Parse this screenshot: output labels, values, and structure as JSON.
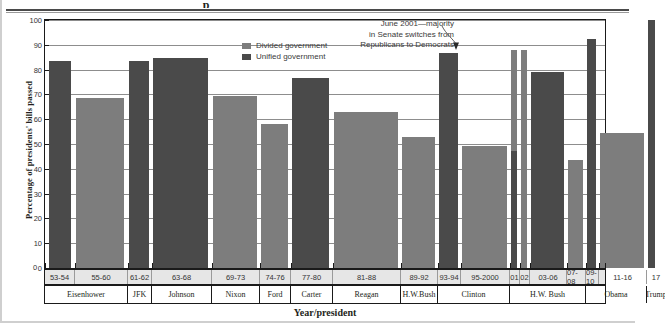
{
  "partial_title_fragment": "p",
  "axes": {
    "ylabel": "Percentage of presidents' bills passed",
    "xlabel": "Year/president",
    "yticks": [
      "0",
      "10",
      "20",
      "30",
      "40",
      "50",
      "60",
      "70",
      "80",
      "90",
      "100"
    ],
    "ymin": 0,
    "ymax": 100
  },
  "legend": {
    "items": [
      {
        "label": "Divided government",
        "color": "#7d7d7d",
        "icon": "legend-swatch"
      },
      {
        "label": "Unified government",
        "color": "#4a4a4a",
        "icon": "legend-swatch"
      }
    ]
  },
  "annotation": {
    "line1": "June 2001—majority",
    "line2": "in Senate switches from",
    "line3": "Republicans to Democrats",
    "icon": "annotation-arrow-icon"
  },
  "colors": {
    "divided": "#7d7d7d",
    "unified": "#4a4a4a",
    "grid": "#8d8d8d",
    "axis": "#1a1a1a",
    "band_fill": "#e6e6e6"
  },
  "presidents": [
    {
      "name": "Eisenhower",
      "span_cols": 2
    },
    {
      "name": "JFK",
      "span_cols": 1
    },
    {
      "name": "Johnson",
      "span_cols": 1
    },
    {
      "name": "Nixon",
      "span_cols": 1
    },
    {
      "name": "Ford",
      "span_cols": 1
    },
    {
      "name": "Carter",
      "span_cols": 1
    },
    {
      "name": "Reagan",
      "span_cols": 1
    },
    {
      "name": "H.W.Bush",
      "span_cols": 1
    },
    {
      "name": "Clinton",
      "span_cols": 2
    },
    {
      "name": "H.W. Bush",
      "span_cols": 4
    },
    {
      "name": "Obama",
      "span_cols": 2
    },
    {
      "name": "Trump",
      "span_cols": 1
    }
  ],
  "chart_data": {
    "type": "bar",
    "title": "",
    "xlabel": "Year/president",
    "ylabel": "Percentage of presidents' bills passed",
    "ylim": [
      0,
      100
    ],
    "ytick_step": 10,
    "grid": true,
    "legend_position": "top-center",
    "categories": [
      "53-54",
      "55-60",
      "61-62",
      "63-68",
      "69-73",
      "74-76",
      "77-80",
      "81-88",
      "89-92",
      "93-94",
      "95-2000",
      "01",
      "02",
      "03-06",
      "07-08",
      "09-10",
      "11-16",
      "17"
    ],
    "president_for_category": [
      "Eisenhower",
      "Eisenhower",
      "JFK",
      "Johnson",
      "Nixon",
      "Ford",
      "Carter",
      "Reagan",
      "H.W.Bush",
      "Clinton",
      "Clinton",
      "H.W. Bush",
      "H.W. Bush",
      "H.W. Bush",
      "H.W. Bush",
      "Obama",
      "Obama",
      "Trump"
    ],
    "values": [
      83.5,
      68.5,
      83.5,
      84.5,
      69.5,
      58,
      76.5,
      63,
      53,
      86.5,
      49,
      88,
      88,
      79,
      43.5,
      92.5,
      54.5,
      100
    ],
    "government": [
      "unified",
      "divided",
      "unified",
      "unified",
      "divided",
      "divided",
      "unified",
      "divided",
      "divided",
      "unified",
      "divided",
      "mixed",
      "divided",
      "unified",
      "divided",
      "unified",
      "divided",
      "unified"
    ],
    "notes": [
      "Bar '01' is split: unified (Republican) in the lower portion, divided above, marking the June 2001 Senate majority switch.",
      "Trump '17' bar reaches 100."
    ]
  },
  "bars": [
    {
      "cat": "53-54",
      "value": 83.5,
      "gov": "unified",
      "x": 4,
      "w": 22
    },
    {
      "cat": "55-60",
      "value": 68.5,
      "gov": "divided",
      "x": 31,
      "w": 48
    },
    {
      "cat": "61-62",
      "value": 83.5,
      "gov": "unified",
      "x": 84,
      "w": 20
    },
    {
      "cat": "63-68",
      "value": 84.5,
      "gov": "unified",
      "x": 108,
      "w": 55
    },
    {
      "cat": "69-73",
      "value": 69.5,
      "gov": "divided",
      "x": 168,
      "w": 44
    },
    {
      "cat": "74-76",
      "value": 58,
      "gov": "divided",
      "x": 216,
      "w": 27
    },
    {
      "cat": "77-80",
      "value": 76.5,
      "gov": "unified",
      "x": 247,
      "w": 37
    },
    {
      "cat": "81-88",
      "value": 63,
      "gov": "divided",
      "x": 289,
      "w": 64
    },
    {
      "cat": "89-92",
      "value": 53,
      "gov": "divided",
      "x": 357,
      "w": 33
    },
    {
      "cat": "93-94",
      "value": 86.5,
      "gov": "unified",
      "x": 394,
      "w": 19
    },
    {
      "cat": "95-2000",
      "value": 49,
      "gov": "divided",
      "x": 417,
      "w": 45
    },
    {
      "cat": "01",
      "value": 88,
      "gov": "mixed",
      "x": 466,
      "w": 6,
      "split_at": 47
    },
    {
      "cat": "02",
      "value": 88,
      "gov": "divided",
      "x": 476,
      "w": 6
    },
    {
      "cat": "03-06",
      "value": 79,
      "gov": "unified",
      "x": 486,
      "w": 33
    },
    {
      "cat": "07-08",
      "value": 43.5,
      "gov": "divided",
      "x": 523,
      "w": 15
    },
    {
      "cat": "09-10",
      "value": 92.5,
      "gov": "unified",
      "x": 542,
      "w": 9
    },
    {
      "cat": "11-16",
      "value": 54.5,
      "gov": "divided",
      "x": 555,
      "w": 44
    },
    {
      "cat": "17",
      "value": 100,
      "gov": "unified",
      "x": 603,
      "w": 7
    }
  ],
  "year_cells": [
    {
      "label": "53-54",
      "x": 0,
      "w": 30
    },
    {
      "label": "55-60",
      "x": 30,
      "w": 53
    },
    {
      "label": "61-62",
      "x": 83,
      "w": 24
    },
    {
      "label": "63-68",
      "x": 107,
      "w": 60
    },
    {
      "label": "69-73",
      "x": 167,
      "w": 48
    },
    {
      "label": "74-76",
      "x": 215,
      "w": 31
    },
    {
      "label": "77-80",
      "x": 246,
      "w": 42
    },
    {
      "label": "81-88",
      "x": 288,
      "w": 68
    },
    {
      "label": "89-92",
      "x": 356,
      "w": 37
    },
    {
      "label": "93-94",
      "x": 393,
      "w": 23
    },
    {
      "label": "95-2000",
      "x": 416,
      "w": 49
    },
    {
      "label": "01",
      "x": 465,
      "w": 10
    },
    {
      "label": "02",
      "x": 475,
      "w": 10
    },
    {
      "label": "03-06",
      "x": 485,
      "w": 37
    },
    {
      "label": "07-08",
      "x": 522,
      "w": 19
    },
    {
      "label": "09-10",
      "x": 541,
      "w": 13
    },
    {
      "label": "11-16",
      "x": 554,
      "w": 48
    },
    {
      "label": "17",
      "x": 602,
      "w": 18
    }
  ],
  "president_cells": [
    {
      "label": "Eisenhower",
      "x": 0,
      "w": 83
    },
    {
      "label": "JFK",
      "x": 83,
      "w": 24
    },
    {
      "label": "Johnson",
      "x": 107,
      "w": 60
    },
    {
      "label": "Nixon",
      "x": 167,
      "w": 48
    },
    {
      "label": "Ford",
      "x": 215,
      "w": 31
    },
    {
      "label": "Carter",
      "x": 246,
      "w": 42
    },
    {
      "label": "Reagan",
      "x": 288,
      "w": 68
    },
    {
      "label": "H.W.Bush",
      "x": 356,
      "w": 37
    },
    {
      "label": "Clinton",
      "x": 393,
      "w": 72
    },
    {
      "label": "H.W. Bush",
      "x": 465,
      "w": 76
    },
    {
      "label": "Obama",
      "x": 541,
      "w": 61
    },
    {
      "label": "Trump",
      "x": 602,
      "w": 18
    }
  ]
}
